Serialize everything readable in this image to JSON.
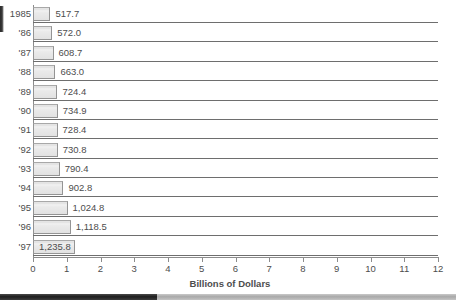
{
  "chart_data": {
    "type": "bar",
    "orientation": "horizontal",
    "title": "",
    "xlabel": "Billions of Dollars",
    "ylabel": "",
    "xlim": [
      0,
      12
    ],
    "xticks": [
      "0",
      "1",
      "2",
      "3",
      "4",
      "5",
      "6",
      "7",
      "8",
      "9",
      "10",
      "11",
      "12"
    ],
    "grid": false,
    "legend": null,
    "categories": [
      "1985",
      "'86",
      "'87",
      "'88",
      "'89",
      "'90",
      "'91",
      "'92",
      "'93",
      "'94",
      "'95",
      "'96",
      "'97"
    ],
    "values": [
      517.7,
      572.0,
      608.7,
      663.0,
      724.4,
      734.9,
      728.4,
      730.8,
      790.4,
      902.8,
      1024.8,
      1118.5,
      1235.8
    ],
    "value_unit": "millions of dollars plotted against a billions-of-dollars axis",
    "data_labels": [
      "517.7",
      "572.0",
      "608.7",
      "663.0",
      "724.4",
      "734.9",
      "728.4",
      "730.8",
      "790.4",
      "902.8",
      "1,024.8",
      "1,118.5",
      "1,235.8"
    ],
    "data_label_placement": [
      "outside",
      "outside",
      "outside",
      "outside",
      "outside",
      "outside",
      "outside",
      "outside",
      "outside",
      "outside",
      "outside",
      "outside",
      "inside"
    ],
    "colors": {
      "bar_fill": "#e6e6e6",
      "bar_border": "#949494",
      "axis": "#8c8c8c",
      "text": "#4d4d4d",
      "rule": "#6e6e6e"
    }
  },
  "bottom_strip": {
    "thumb_label": "",
    "track_label": ""
  }
}
